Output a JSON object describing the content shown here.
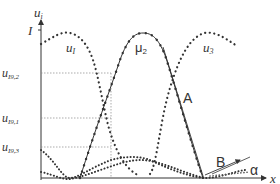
{
  "diagram": {
    "axes": {
      "y_label": "u",
      "y_label_sub": "i",
      "x_label": "x",
      "y_top_tick": "I"
    },
    "y_ticks": [
      {
        "main": "u",
        "sub": "I9,2",
        "y": 73
      },
      {
        "main": "u",
        "sub": "I9,1",
        "y": 118
      },
      {
        "main": "u",
        "sub": "I9,3",
        "y": 147
      }
    ],
    "x_ticks": [
      {
        "main": "v",
        "sub": "1",
        "x": 68
      },
      {
        "main": "x",
        "sub": "I9",
        "x": 111
      },
      {
        "main": "v",
        "sub": "2",
        "x": 143
      },
      {
        "main": "v",
        "sub": "3",
        "x": 204
      }
    ],
    "curve_labels": {
      "u1_main": "u",
      "u1_sub": "I",
      "mu2_main": "μ",
      "mu2_sub": "2",
      "u3_main": "u",
      "u3_sub": "3"
    },
    "annotations": {
      "line_a": "A",
      "line_b": "B",
      "angle": "α"
    },
    "colors": {
      "ink": "#333333",
      "guide": "#888888"
    }
  }
}
